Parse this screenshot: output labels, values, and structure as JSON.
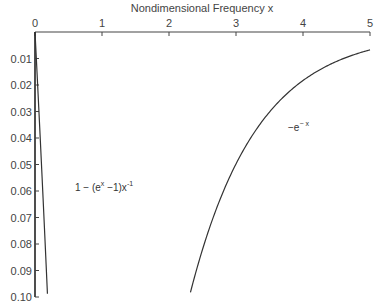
{
  "chart_data": {
    "type": "line",
    "title": "",
    "xlabel": "Nondimensional Frequency x",
    "ylabel": "",
    "xlim": [
      0,
      5
    ],
    "ylim": [
      0,
      0.1
    ],
    "y_inverted": true,
    "x_axis_position": "top",
    "grid": false,
    "x_ticks": [
      "0",
      "1",
      "2",
      "3",
      "4",
      "5"
    ],
    "y_ticks": [
      "0.01",
      "0.02",
      "0.03",
      "0.04",
      "0.05",
      "0.06",
      "0.07",
      "0.08",
      "0.09",
      "0.10"
    ],
    "series": [
      {
        "name": "1 − (e^x − 1) x^−1",
        "note": "plotted as magnitude (value shown downward)",
        "x": [
          0.0,
          0.02,
          0.05,
          0.08,
          0.1,
          0.12,
          0.15,
          0.19
        ],
        "y": [
          0.0,
          0.0101,
          0.0254,
          0.0411,
          0.0517,
          0.0624,
          0.0785,
          0.1
        ]
      },
      {
        "name": "−e^−x",
        "note": "plotted as magnitude (value shown downward)",
        "x": [
          2.3,
          2.5,
          2.75,
          3.0,
          3.25,
          3.5,
          3.75,
          4.0,
          4.25,
          4.5,
          4.75,
          5.0
        ],
        "y": [
          0.1003,
          0.0821,
          0.0639,
          0.0498,
          0.0388,
          0.0302,
          0.0235,
          0.0183,
          0.0143,
          0.0111,
          0.0087,
          0.0067
        ]
      }
    ],
    "annotations": [
      {
        "text": "1 − (e^x − 1)x^−1",
        "x": 0.6,
        "y": 0.061
      },
      {
        "text": "−e^−x",
        "x": 3.8,
        "y": 0.047
      }
    ]
  },
  "labels": {
    "xlabel": "Nondimensional Frequency x",
    "annot1_main": "1 − (e",
    "annot1_sup1": "x",
    "annot1_mid": " −1)x",
    "annot1_sup2": "-1",
    "annot2_main": "−e",
    "annot2_sup": "− x"
  }
}
